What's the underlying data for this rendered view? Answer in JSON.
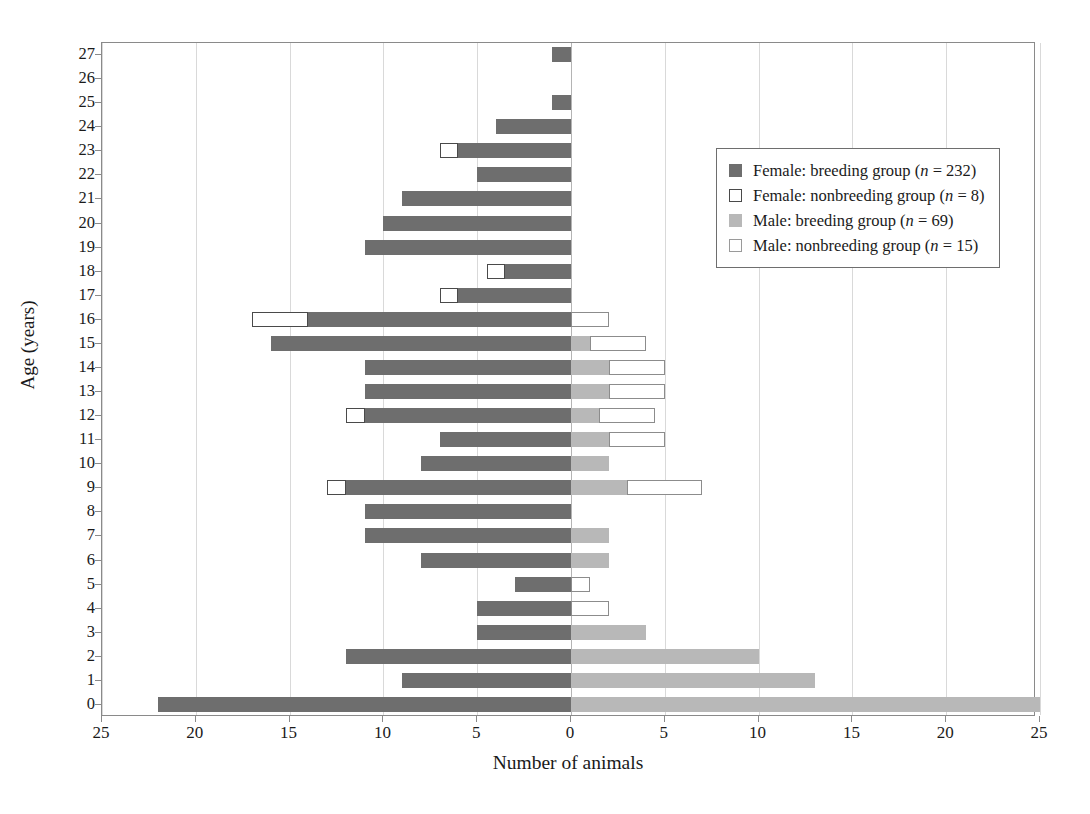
{
  "chart_data": {
    "type": "bar",
    "subtype": "population-pyramid",
    "title": "",
    "xlabel": "Number of animals",
    "ylabel": "Age (years)",
    "xlim": [
      -25,
      25
    ],
    "x_tick_values": [
      -25,
      -20,
      -15,
      -10,
      -5,
      0,
      5,
      10,
      15,
      20,
      25
    ],
    "x_tick_labels": [
      "25",
      "20",
      "15",
      "10",
      "5",
      "0",
      "5",
      "10",
      "15",
      "20",
      "25"
    ],
    "categories": [
      27,
      26,
      25,
      24,
      23,
      22,
      21,
      20,
      19,
      18,
      17,
      16,
      15,
      14,
      13,
      12,
      11,
      10,
      9,
      8,
      7,
      6,
      5,
      4,
      3,
      2,
      1,
      0
    ],
    "grid": "vertical-dotted",
    "legend_position": "upper-right",
    "series": [
      {
        "name": "Female: breeding group",
        "side": "left",
        "color": "#6e6e6e",
        "fill": "solid",
        "n": 232,
        "values": [
          1,
          0,
          1,
          4,
          6,
          5,
          9,
          10,
          11,
          3.5,
          6,
          14,
          16,
          11,
          11,
          11,
          7,
          8,
          12,
          11,
          11,
          8,
          3,
          5,
          5,
          12,
          9,
          22
        ]
      },
      {
        "name": "Female: nonbreeding group",
        "side": "left",
        "color": "#ffffff",
        "fill": "outline",
        "n": 8,
        "values": [
          0,
          0,
          0,
          0,
          1,
          0,
          0,
          0,
          0,
          1,
          1,
          3,
          0,
          0,
          0,
          1,
          0,
          0,
          1,
          0,
          0,
          0,
          0,
          0,
          0,
          0,
          0,
          0
        ]
      },
      {
        "name": "Male: breeding group",
        "side": "right",
        "color": "#b8b8b8",
        "fill": "solid",
        "n": 69,
        "values": [
          0,
          0,
          0,
          0,
          0,
          0,
          0,
          0,
          0,
          0,
          0,
          0,
          1,
          2,
          2,
          1.5,
          2,
          2,
          3,
          0,
          2,
          2,
          0,
          0,
          4,
          10,
          13,
          25
        ]
      },
      {
        "name": "Male: nonbreeding group",
        "side": "right",
        "color": "#ffffff",
        "fill": "outline",
        "n": 15,
        "values": [
          0,
          0,
          0,
          0,
          0,
          0,
          0,
          0,
          0,
          0,
          0,
          2,
          3,
          3,
          3,
          3,
          3,
          0,
          4,
          0,
          0,
          0,
          1,
          2,
          0,
          0,
          0,
          0
        ]
      }
    ]
  },
  "legend": {
    "items": [
      {
        "label_prefix": "Female: breeding group (",
        "label_italic": "n",
        "label_suffix": " = 232)",
        "swatch": "sw-female-breeding",
        "icon_name": "legend-swatch-female-breeding"
      },
      {
        "label_prefix": "Female: nonbreeding group (",
        "label_italic": "n",
        "label_suffix": " = 8)",
        "swatch": "sw-female-nonbreeding",
        "icon_name": "legend-swatch-female-nonbreeding"
      },
      {
        "label_prefix": "Male: breeding group (",
        "label_italic": "n",
        "label_suffix": " = 69)",
        "swatch": "sw-male-breeding",
        "icon_name": "legend-swatch-male-breeding"
      },
      {
        "label_prefix": "Male: nonbreeding group (",
        "label_italic": "n",
        "label_suffix": " = 15)",
        "swatch": "sw-male-nonbreeding",
        "icon_name": "legend-swatch-male-nonbreeding"
      }
    ]
  },
  "colors": {
    "female_breeding": "#6e6e6e",
    "male_breeding": "#b8b8b8",
    "outline": "#4a4a4a",
    "axis": "#8a8a8a",
    "grid": "#d9d9d9",
    "background": "#ffffff"
  }
}
